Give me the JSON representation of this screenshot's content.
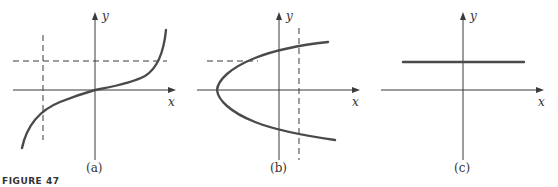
{
  "figure_label": "FIGURE 47",
  "panels": [
    {
      "id": "a",
      "caption": "(a)",
      "x_label": "x",
      "y_label": "y",
      "description": "Cubic-like increasing curve through origin; vertical dashed line intersects once, horizontal dashed line intersects once"
    },
    {
      "id": "b",
      "caption": "(b)",
      "x_label": "x",
      "y_label": "y",
      "description": "Sideways parabola opening right; horizontal dashed line intersects once, vertical dashed line intersects twice"
    },
    {
      "id": "c",
      "caption": "(c)",
      "x_label": "x",
      "y_label": "y",
      "description": "Horizontal line above x-axis"
    }
  ],
  "colors": {
    "curve": "#4a4a4a",
    "axis": "#3a3a3a"
  }
}
